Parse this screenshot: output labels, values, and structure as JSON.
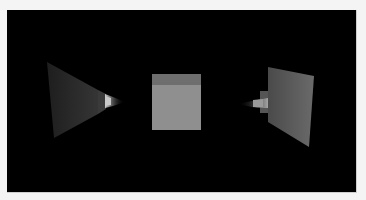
{
  "scene": {
    "background_color": "#000000",
    "objects": [
      {
        "name": "left-frustum",
        "type": "pyramid",
        "base_color": "#2a2a2a",
        "tip_color": "#bdbdbd"
      },
      {
        "name": "center-cube",
        "type": "cube",
        "front_color": "#8f8f8f",
        "top_color": "#6e6e6e"
      },
      {
        "name": "right-frustum",
        "type": "pyramid",
        "base_color": "#5f5f5f",
        "tip_color": "#9a9a9a"
      }
    ]
  }
}
